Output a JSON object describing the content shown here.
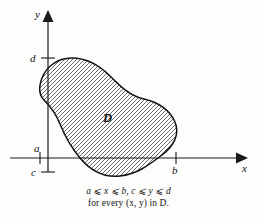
{
  "figure": {
    "background_color": "#fdfdfc",
    "ink_color": "#111111"
  },
  "axes": {
    "x_axis_label": "x",
    "y_axis_label": "y",
    "origin_px": {
      "x": 48,
      "y": 158
    },
    "x_axis_extent_px": {
      "from": 10,
      "to": 240
    },
    "y_axis_extent_px": {
      "from": 170,
      "to": 14
    }
  },
  "ticks": [
    {
      "name": "d",
      "label": "d",
      "axis": "y",
      "y_px": 58,
      "label_x_px": 30,
      "label_y_px": 62
    },
    {
      "name": "a",
      "label": "a",
      "axis": "x",
      "x_px": 40,
      "label_x_px": 35,
      "label_y_px": 152
    },
    {
      "name": "c",
      "label": "c",
      "axis": "y",
      "y_px": 172,
      "label_x_px": 31,
      "label_y_px": 176
    },
    {
      "name": "b",
      "label": "b",
      "axis": "x",
      "x_px": 176,
      "label_x_px": 172,
      "label_y_px": 173
    }
  ],
  "region": {
    "label": "D",
    "label_x_px": 103,
    "label_y_px": 122,
    "hatch_angle_deg": 45,
    "hatch_spacing_px": 4,
    "outline_path": "M 72,58 C 88,58 100,66 110,76 C 120,86 130,96 144,99 C 158,102 170,110 175,122 C 180,134 174,146 162,155 C 150,164 138,174 120,176 C 102,178 90,170 80,158 C 70,146 64,134 60,124 C 56,114 50,106 44,100 C 38,94 39,86 42,78 C 46,68 56,58 72,58 Z"
  },
  "caption": {
    "line1": "a ⩽ x ⩽ b, c ⩽ y ⩽ d",
    "line2": "for every (x, y) in D."
  }
}
